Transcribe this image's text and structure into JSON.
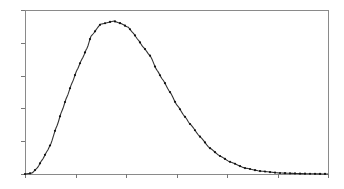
{
  "chart_data": {
    "type": "line",
    "title": "",
    "xlabel": "",
    "ylabel": "",
    "xlim": [
      0,
      6
    ],
    "ylim": [
      0,
      5
    ],
    "x_ticks": [
      0,
      1,
      2,
      3,
      4,
      5,
      6
    ],
    "y_ticks": [
      0,
      1,
      2,
      3,
      4,
      5
    ],
    "tick_labels_visible": false,
    "grid": false,
    "legend": null,
    "series": [
      {
        "name": "curve",
        "style": "solid line with small dot markers",
        "color": "#222222",
        "x": [
          0.0,
          0.14,
          0.24,
          0.34,
          0.44,
          0.5,
          0.63,
          0.73,
          0.83,
          0.93,
          1.03,
          1.13,
          1.23,
          1.31,
          1.5,
          1.76,
          1.88,
          2.04,
          2.14,
          2.24,
          2.34,
          2.48,
          2.61,
          2.73,
          2.87,
          3.01,
          3.17,
          3.27,
          3.47,
          3.66,
          3.86,
          4.06,
          4.36,
          4.65,
          5.05,
          5.5,
          6.0
        ],
        "y": [
          0.0,
          0.03,
          0.18,
          0.43,
          0.7,
          0.88,
          1.46,
          1.92,
          2.35,
          2.77,
          3.17,
          3.51,
          3.84,
          4.21,
          4.57,
          4.66,
          4.6,
          4.48,
          4.3,
          4.09,
          3.87,
          3.6,
          3.17,
          2.87,
          2.5,
          2.1,
          1.74,
          1.52,
          1.13,
          0.79,
          0.55,
          0.37,
          0.18,
          0.09,
          0.03,
          0.01,
          0.0
        ]
      }
    ],
    "peak": {
      "x": 1.76,
      "y": 4.66
    }
  },
  "plot_area": {
    "left": 25,
    "top": 10,
    "right": 328,
    "bottom": 174
  },
  "colors": {
    "frame": "#8a8a8a",
    "line": "#333333",
    "marker": "#111111",
    "background": "#ffffff"
  }
}
